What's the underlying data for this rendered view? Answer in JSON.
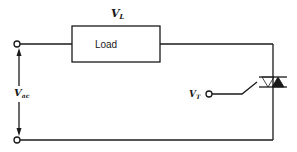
{
  "diagram": {
    "type": "circuit-schematic",
    "labels": {
      "load_voltage": {
        "main": "V",
        "sub": "L"
      },
      "source_voltage": {
        "main": "V",
        "sub": "ac"
      },
      "trigger_voltage": {
        "main": "V",
        "sub": "T"
      },
      "load_box": "Load"
    },
    "components": [
      {
        "id": "source-terminal-top",
        "type": "terminal"
      },
      {
        "id": "source-terminal-bottom",
        "type": "terminal"
      },
      {
        "id": "load",
        "type": "resistive-load",
        "label": "Load"
      },
      {
        "id": "triac",
        "type": "triac"
      },
      {
        "id": "gate-terminal",
        "type": "terminal"
      }
    ],
    "connections": [
      [
        "source-terminal-top",
        "load"
      ],
      [
        "load",
        "triac"
      ],
      [
        "triac",
        "source-terminal-bottom"
      ],
      [
        "gate-terminal",
        "triac"
      ]
    ],
    "colors": {
      "line": "#1a1a1a",
      "background": "#ffffff"
    }
  }
}
